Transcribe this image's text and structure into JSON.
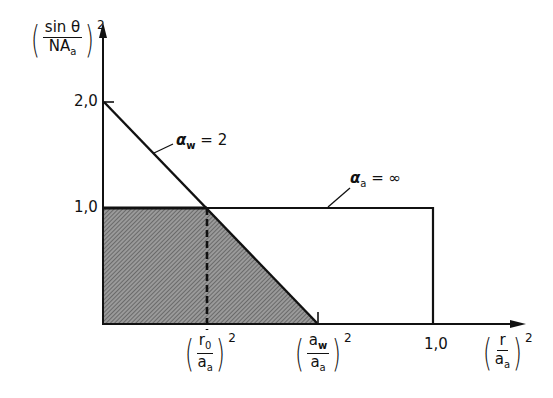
{
  "diagram": {
    "y_axis": {
      "label_numerator": "sin θ",
      "label_denominator_main": "NA",
      "label_denominator_sub": "a",
      "exponent": "2",
      "ticks": [
        "2,0",
        "1,0"
      ]
    },
    "x_axis": {
      "label_numerator": "r",
      "label_denominator_main": "a",
      "label_denominator_sub": "a",
      "exponent": "2",
      "ticks": [
        {
          "num_main": "r",
          "num_sub": "0",
          "den_main": "a",
          "den_sub": "a",
          "exp": "2"
        },
        {
          "num_main": "a",
          "num_sub": "w",
          "den_main": "a",
          "den_sub": "a",
          "exp": "2"
        },
        {
          "text": "1,0"
        }
      ]
    },
    "curves": [
      {
        "label_symbol": "α",
        "label_sub": "w",
        "label_value": "= 2"
      },
      {
        "label_symbol": "α",
        "label_sub": "a",
        "label_value": "= ∞"
      }
    ],
    "colors": {
      "line": "#111111",
      "hatch": "#8a8a8a",
      "background": "#ffffff"
    }
  }
}
